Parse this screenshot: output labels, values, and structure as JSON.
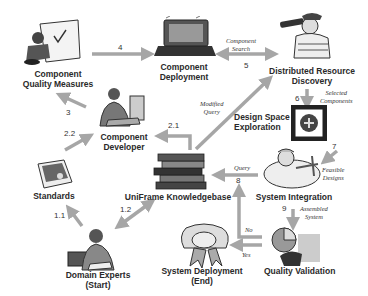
{
  "nodes": {
    "quality_measures": {
      "line1": "Component",
      "line2": "Quality Measures"
    },
    "deployment": {
      "line1": "Component",
      "line2": "Deployment"
    },
    "discovery": {
      "line1": "Distributed Resource",
      "line2": "Discovery"
    },
    "developer": {
      "line1": "Component",
      "line2": "Developer"
    },
    "design_space": {
      "line1": "Design Space",
      "line2": "Exploration"
    },
    "standards": {
      "line1": "Standards"
    },
    "knowledgebase": {
      "line1": "UniFrame Knowledgebase"
    },
    "integration": {
      "line1": "System Integration"
    },
    "domain_experts": {
      "line1": "Domain Experts",
      "line2": "(Start)"
    },
    "system_deployment": {
      "line1": "System Deployment",
      "line2": "(End)"
    },
    "quality_validation": {
      "line1": "Quality Validation"
    }
  },
  "edges": {
    "e4": {
      "num": "4"
    },
    "e5": {
      "num": "5",
      "caption1": "Component",
      "caption2": "Search"
    },
    "e6": {
      "num": "6",
      "caption1": "Selected",
      "caption2": "Components"
    },
    "e3": {
      "num": "3"
    },
    "e22": {
      "num": "2.2"
    },
    "e21": {
      "num": "2.1",
      "caption1": "Modified",
      "caption2": "Query"
    },
    "e7": {
      "num": "7",
      "caption1": "Feasible",
      "caption2": "Designs"
    },
    "e8": {
      "num": "8",
      "caption1": "Query"
    },
    "e9": {
      "num": "9",
      "caption1": "Assembled",
      "caption2": "System"
    },
    "e11": {
      "num": "1.1"
    },
    "e12": {
      "num": "1.2"
    },
    "no": {
      "caption1": "No"
    },
    "yes": {
      "caption1": "Yes"
    }
  },
  "colors": {
    "arrow": "#a6a6a6",
    "text": "#2a2a2a"
  }
}
